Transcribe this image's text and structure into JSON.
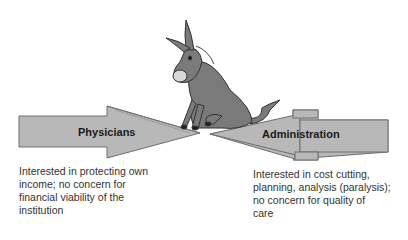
{
  "diagram": {
    "left_arrow": {
      "label": "Physicians",
      "description": "Interested in protecting own\nincome; no concern for\nfinancial viability of the\ninstitution",
      "fill": "#b8b8b8"
    },
    "right_arrow": {
      "label": "Administration",
      "description": "Interested in cost cutting,\nplanning, analysis (paralysis);\nno concern for quality of\ncare",
      "fill": "#b8b8b8"
    },
    "center_figure": "donkey-sitting",
    "colors": {
      "arrow_fill": "#b8b8b8",
      "arrow_stroke": "#6e6e6e",
      "donkey_body": "#7a7a7a",
      "donkey_outline": "#333333",
      "text": "#333333"
    }
  }
}
